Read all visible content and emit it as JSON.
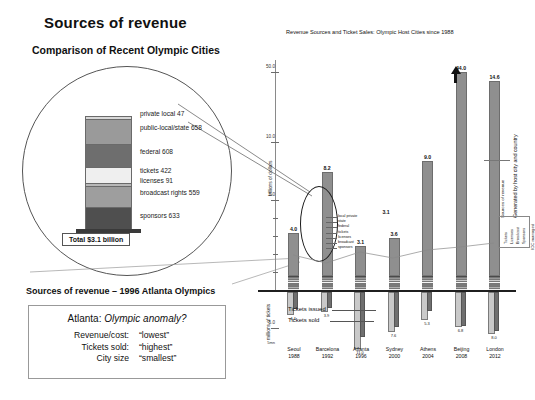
{
  "slide": {
    "title": "Sources of revenue",
    "subtitle_left": "Comparison of Recent Olympic Cities",
    "subtitle_left2": "Sources of revenue – 1996 Atlanta Olympics"
  },
  "exploded": {
    "total_label": "Total $3.1 billion",
    "segments": [
      {
        "label": "private  local  47",
        "value": 47,
        "color": "#d8d8d8"
      },
      {
        "label": "public-local/state  658",
        "value": 658,
        "color": "#9a9a9a"
      },
      {
        "label": "federal 608",
        "value": 608,
        "color": "#6e6e6e"
      },
      {
        "label": "tickets  422",
        "value": 422,
        "color": "#efefef"
      },
      {
        "label": "licenses  91",
        "value": 91,
        "color": "#b8b8b8"
      },
      {
        "label": "broadcast rights  559",
        "value": 559,
        "color": "#9e9e9e"
      },
      {
        "label": "sponsors  633",
        "value": 633,
        "color": "#4f4f4f"
      }
    ]
  },
  "anomaly": {
    "heading_city": "Atlanta:",
    "heading_q": "Olympic anomaly?",
    "rows": [
      {
        "key": "Revenue/cost:",
        "value": "“lowest”"
      },
      {
        "key": "Tickets sold:",
        "value": "“highest”"
      },
      {
        "key": "City size",
        "value": "“smallest”"
      }
    ]
  },
  "chart_data": {
    "type": "bar",
    "title": "Revenue Sources and Ticket Sales: Olympic Host Cities since 1988",
    "xlabel": "",
    "ylabel": "billions of dollars",
    "ylabel2": "millions of tickets",
    "categories": [
      "Seoul",
      "Barcelona",
      "Atlanta",
      "Sydney",
      "Athens",
      "Beijing",
      "London"
    ],
    "years": [
      "1988",
      "1992",
      "1996",
      "2000",
      "2004",
      "2008",
      "2012"
    ],
    "ylim": [
      0,
      50
    ],
    "yticks": [
      "50.0",
      "10.0",
      "5.0"
    ],
    "grid": false,
    "series": [
      {
        "name": "Total revenue (billions of dollars)",
        "values": [
          4.0,
          8.2,
          3.1,
          3.6,
          9.0,
          44.0,
          14.6
        ],
        "labels": [
          "4.0",
          "8.2",
          "3.1",
          "3.6",
          "9.0",
          "44.0",
          "14.6"
        ]
      },
      {
        "name": "Tickets issued (millions)",
        "values": [
          4.4,
          3.9,
          11.0,
          7.6,
          5.3,
          6.8,
          8.0
        ],
        "labels": [
          "4.4",
          "3.9",
          "11.0",
          "7.6",
          "5.3",
          "6.8",
          "8.0"
        ]
      },
      {
        "name": "Tickets sold (millions)",
        "values": [
          3.3,
          3.0,
          8.6,
          6.7,
          3.6,
          6.5,
          7.5
        ],
        "labels": [
          "3.3",
          "3.0",
          "8.6",
          "6.7",
          "3.6",
          "6.5",
          "7.5"
        ]
      }
    ],
    "atlanta_breakdown": [
      "local private",
      "state",
      "federal",
      "tickets",
      "licenses",
      "broadcast",
      "sponsors"
    ],
    "key": {
      "tickets_issued": "Tickets issued",
      "tickets_sold": "Tickets sold"
    },
    "legend_entries": [
      "Tickets",
      "Licenses",
      "Broadcast",
      "Sponsors"
    ],
    "legend_group": "IOC managed",
    "annotations": [
      "Generated by host city and country",
      "Sources of revenue"
    ]
  }
}
